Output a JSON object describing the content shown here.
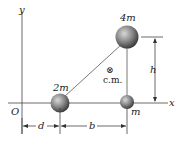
{
  "diagram": {
    "axes": {
      "x_label": "x",
      "y_label": "y",
      "origin_label": "O"
    },
    "masses": [
      {
        "label": "2m",
        "name": "mass-2m"
      },
      {
        "label": "4m",
        "name": "mass-4m"
      },
      {
        "label": "m",
        "name": "mass-m"
      }
    ],
    "center_of_mass": {
      "symbol": "⊗",
      "label": "c.m."
    },
    "dimensions": {
      "d": "d",
      "b": "b",
      "h": "h"
    },
    "colors": {
      "line": "#333333",
      "ball_light": "#cfcfcf",
      "ball_dark": "#3a3a3a"
    }
  }
}
